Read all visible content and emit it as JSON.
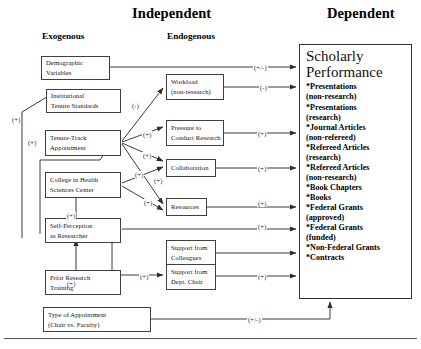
{
  "headers": {
    "independent": "Independent",
    "dependent": "Dependent",
    "exogenous": "Exogenous",
    "endogenous": "Endogenous"
  },
  "exogenous_nodes": [
    {
      "id": "demographic-variables",
      "lines": [
        "Demographic",
        "Variables"
      ]
    },
    {
      "id": "institutional-tenure-standards",
      "lines": [
        "Institutional",
        "Tenure Standards"
      ]
    },
    {
      "id": "tenure-track-appointment",
      "lines": [
        "Tenure-Track",
        "Appointment"
      ]
    },
    {
      "id": "college-in-health-sciences-center",
      "lines": [
        "College in Health",
        "Sciences Center"
      ]
    },
    {
      "id": "self-perception-as-researcher",
      "lines": [
        "Self-Perception",
        "as Researcher"
      ]
    },
    {
      "id": "prior-research-training",
      "lines": [
        "Prior Research",
        "Training"
      ]
    },
    {
      "id": "type-of-appointment",
      "lines": [
        "Type of Appointment",
        "(Chair vs. Faculty)"
      ]
    }
  ],
  "endogenous_nodes": [
    {
      "id": "workload-non-research",
      "lines": [
        "Workload",
        "(non-research)"
      ]
    },
    {
      "id": "pressure-to-conduct-research",
      "lines": [
        "Pressure to",
        "Conduct Research"
      ]
    },
    {
      "id": "collaboration",
      "lines": [
        "Collaboration"
      ]
    },
    {
      "id": "resources",
      "lines": [
        "Resources"
      ]
    },
    {
      "id": "support-from-colleagues",
      "lines": [
        "Support from",
        "Colleagues"
      ]
    },
    {
      "id": "support-from-dept-chair",
      "lines": [
        "Support from",
        "Dept. Chair"
      ]
    }
  ],
  "outcome": {
    "title_lines": [
      "Scholarly",
      "Performance"
    ],
    "items": [
      {
        "main": "*Presentations",
        "cont": "(non-research)"
      },
      {
        "main": "*Presentations",
        "cont": "(research)"
      },
      {
        "main": "*Journal Articles",
        "cont": "(non-refereed)"
      },
      {
        "main": "*Refereed Articles",
        "cont": "(research)"
      },
      {
        "main": "*Refereed Articles",
        "cont": "(non-research)"
      },
      {
        "main": "*Book Chapters",
        "cont": ""
      },
      {
        "main": "*Books",
        "cont": ""
      },
      {
        "main": "*Federal Grants",
        "cont": "(approved)"
      },
      {
        "main": "*Federal Grants",
        "cont": "(funded)"
      },
      {
        "main": "*Non-Federal Grants",
        "cont": ""
      },
      {
        "main": "*Contracts",
        "cont": ""
      }
    ]
  },
  "edge_labels": [
    {
      "id": "demographic-to-outcome",
      "text": "(+/-)",
      "x": 253,
      "y": 64
    },
    {
      "id": "workload-to-outcome",
      "text": "(-)",
      "x": 259,
      "y": 84
    },
    {
      "id": "tenure-to-workload",
      "text": "(-)",
      "x": 131,
      "y": 102
    },
    {
      "id": "tenure-to-pressure",
      "text": "(+)",
      "x": 142,
      "y": 131
    },
    {
      "id": "pressure-to-outcome",
      "text": "(+)",
      "x": 257,
      "y": 130
    },
    {
      "id": "tenure-to-collaboration",
      "text": "(+)",
      "x": 142,
      "y": 152
    },
    {
      "id": "collaboration-to-outcome",
      "text": "(+)",
      "x": 257,
      "y": 165
    },
    {
      "id": "tenure-to-resources",
      "text": "(+)",
      "x": 134,
      "y": 171
    },
    {
      "id": "college-to-collaboration",
      "text": "(+)",
      "x": 153,
      "y": 177
    },
    {
      "id": "college-to-resources",
      "text": "(+)",
      "x": 143,
      "y": 199
    },
    {
      "id": "resources-to-outcome",
      "text": "(+)",
      "x": 257,
      "y": 200
    },
    {
      "id": "selfperception-to-outcome",
      "text": "(+)",
      "x": 257,
      "y": 223
    },
    {
      "id": "selfperception-to-tenure",
      "text": "(+)",
      "x": 27,
      "y": 139
    },
    {
      "id": "selfperception-to-institutional",
      "text": "(+)",
      "x": 11,
      "y": 116
    },
    {
      "id": "prior-to-selfperception",
      "text": "(+)",
      "x": 66,
      "y": 280
    },
    {
      "id": "selfperception-to-college",
      "text": "(+)",
      "x": 66,
      "y": 212
    },
    {
      "id": "selfperception-to-deptchair",
      "text": "(+)",
      "x": 139,
      "y": 273
    },
    {
      "id": "deptchair-to-outcome",
      "text": "(+)",
      "x": 257,
      "y": 273
    },
    {
      "id": "appointment-to-outcome",
      "text": "(+/-)",
      "x": 247,
      "y": 316
    }
  ],
  "colors": {
    "line": "#3a3a3a",
    "box_border": "#404040",
    "text": "#111111",
    "background": "#ffffff"
  }
}
